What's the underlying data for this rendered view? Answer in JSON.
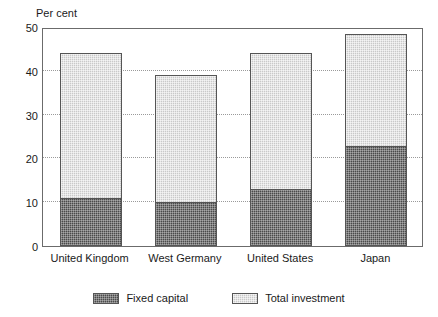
{
  "chart_data": {
    "type": "bar",
    "stacked": true,
    "title": "",
    "subtitle": "",
    "xlabel": "",
    "ylabel": "Per cent",
    "ylim": [
      0,
      50
    ],
    "yticks": [
      0,
      10,
      20,
      30,
      40,
      50
    ],
    "ytick_labels": [
      "0",
      "10",
      "20",
      "30",
      "40",
      "50"
    ],
    "grid": "horizontal-dotted",
    "legend_position": "bottom-center",
    "categories": [
      "United Kingdom",
      "West Germany",
      "United States",
      "Japan"
    ],
    "series": [
      {
        "name": "Fixed capital",
        "color": "#4a4a4a",
        "values": [
          11,
          10,
          13,
          22.8
        ]
      },
      {
        "name": "Total investment",
        "color": "#c9c9c9",
        "values": [
          44,
          39,
          44,
          48.5
        ]
      }
    ]
  },
  "legend": {
    "items": [
      {
        "label": "Fixed capital",
        "swatch": "dark-hatch-swatch"
      },
      {
        "label": "Total investment",
        "swatch": "light-hatch-swatch"
      }
    ]
  },
  "axis": {
    "y_title": "Per cent"
  }
}
